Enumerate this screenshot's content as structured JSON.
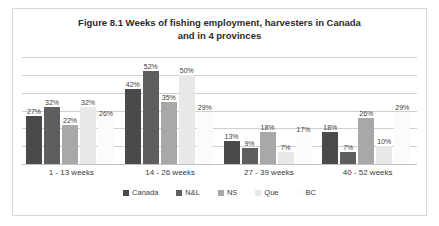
{
  "figure": {
    "title_line1": "Figure 8.1 Weeks of fishing employment, harvesters in Canada",
    "title_line2": "and in 4 provinces",
    "border_color": "#d8d8d8",
    "background_color": "#ffffff"
  },
  "chart_data": {
    "type": "bar",
    "title": "Figure 8.1 Weeks of fishing employment, harvesters in Canada and in 4 provinces",
    "xlabel": "",
    "ylabel": "",
    "categories": [
      "1 - 13 weeks",
      "14 - 26 weeks",
      "27 - 39 weeks",
      "40 - 52 weeks"
    ],
    "series": [
      {
        "name": "Canada",
        "color": "#4a4a4a",
        "values": [
          27,
          42,
          13,
          18
        ],
        "labels": [
          "27%",
          "42%",
          "13%",
          "18%"
        ]
      },
      {
        "name": "N&L",
        "color": "#5e5e5e",
        "values": [
          32,
          52,
          9,
          7
        ],
        "labels": [
          "32%",
          "52%",
          "9%",
          "7%"
        ]
      },
      {
        "name": "NS",
        "color": "#a8a8a8",
        "values": [
          22,
          35,
          18,
          26
        ],
        "labels": [
          "22%",
          "35%",
          "18%",
          "26%"
        ]
      },
      {
        "name": "Que",
        "color": "#e8e8e8",
        "values": [
          32,
          50,
          7,
          10
        ],
        "labels": [
          "32%",
          "50%",
          "7%",
          "10%"
        ]
      },
      {
        "name": "BC",
        "color": "#fbfbfb",
        "values": [
          26,
          29,
          17,
          29
        ],
        "labels": [
          "26%",
          "29%",
          "17%",
          "29%"
        ]
      }
    ],
    "ylim": [
      0,
      60
    ],
    "gridlines": [
      0,
      10,
      20,
      30,
      40,
      50,
      60
    ],
    "grid": true,
    "value_labels": true,
    "legend_position": "bottom"
  }
}
